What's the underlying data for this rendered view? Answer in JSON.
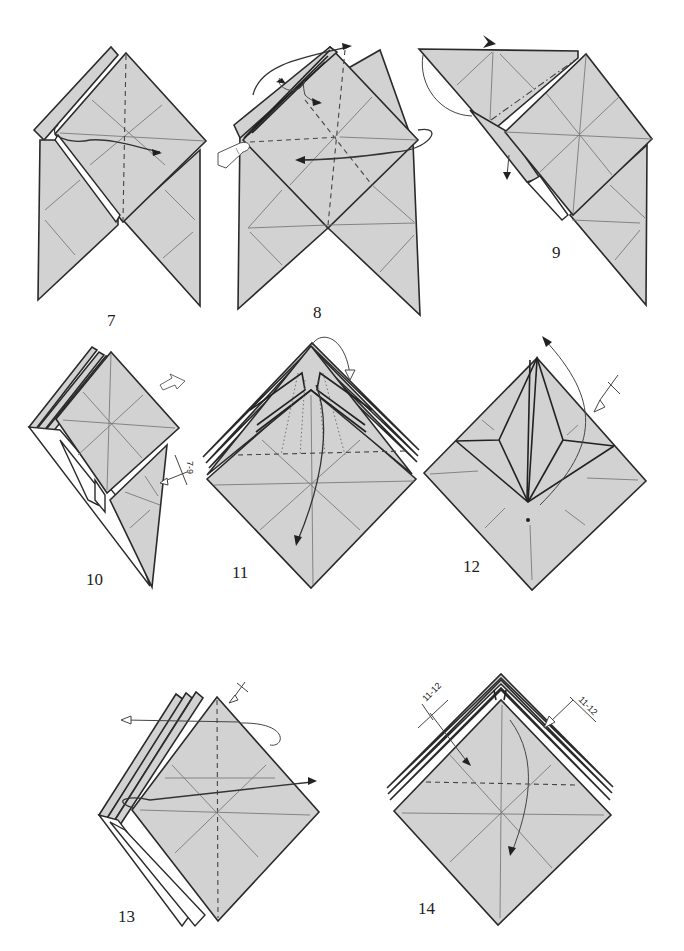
{
  "diagram": {
    "type": "origami folding instructions",
    "steps": [
      {
        "number": "7",
        "label_pos": [
          111,
          330
        ],
        "instruction": "valley fold flap right along vertical center line"
      },
      {
        "number": "8",
        "label_pos": [
          317,
          322
        ],
        "instruction": "squash/valley fold with pleats; hold with finger"
      },
      {
        "number": "9",
        "label_pos": [
          556,
          262
        ],
        "instruction": "mountain fold; push in at arrow"
      },
      {
        "number": "10",
        "label_pos": [
          88,
          582
        ],
        "instruction": "repeat steps 7-9; turn over"
      },
      {
        "number": "11",
        "label_pos": [
          234,
          580
        ],
        "instruction": "valley fold flap down; reverse folds"
      },
      {
        "number": "12",
        "label_pos": [
          461,
          575
        ],
        "instruction": "fold point up; repeat behind"
      },
      {
        "number": "13",
        "label_pos": [
          120,
          920
        ],
        "instruction": "fold flap right; repeat behind"
      },
      {
        "number": "14",
        "label_pos": [
          418,
          912
        ],
        "instruction": "repeat steps 11-12; valley fold down"
      }
    ],
    "annotations": {
      "step10_repeat": "7-9",
      "step14_repeat_left": "11-12",
      "step14_repeat_right": "11-12"
    },
    "colors": {
      "paper": "#d2d2d2",
      "edge": "#2a2a2a",
      "crease": "#7a7a7a",
      "background": "#ffffff"
    }
  }
}
